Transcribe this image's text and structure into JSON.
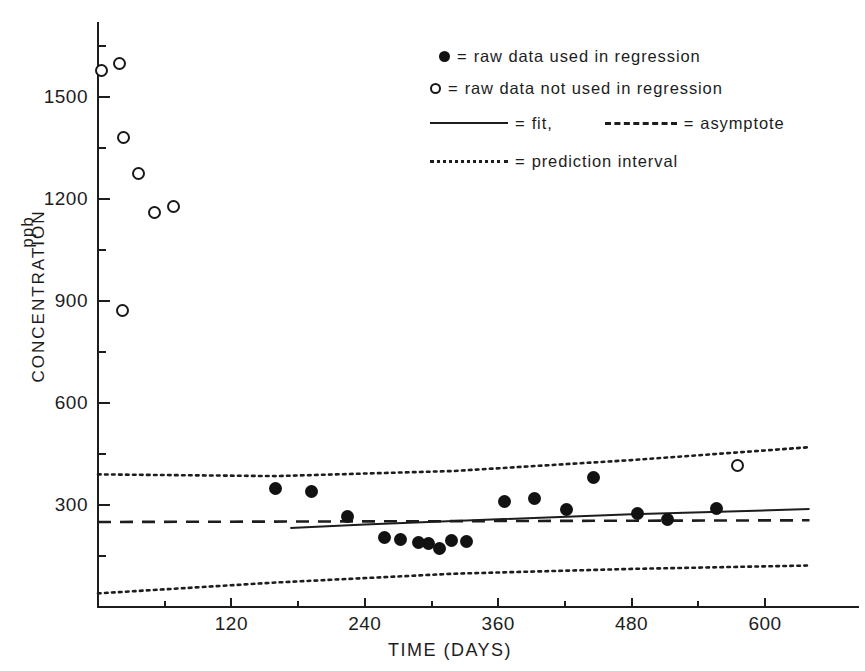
{
  "chart_data": {
    "type": "scatter",
    "title": "",
    "xlabel": "TIME (DAYS)",
    "ylabel": "CONCENTRATION",
    "yunits": "ppb",
    "xlim": [
      0,
      640
    ],
    "ylim": [
      0,
      1740
    ],
    "grid": false,
    "legend_position": "top-right",
    "xticks": [
      120,
      240,
      360,
      480,
      600
    ],
    "xticks_minor": [
      60,
      180,
      300,
      420,
      540,
      600
    ],
    "yticks": [
      300,
      600,
      900,
      1200,
      1500
    ],
    "yticks_minor": [
      150,
      450,
      750,
      1050,
      1350,
      1650
    ],
    "series": [
      {
        "name": "raw data used in regression",
        "marker": "filled-circle",
        "points": [
          {
            "x": 160,
            "y": 348
          },
          {
            "x": 192,
            "y": 340
          },
          {
            "x": 224,
            "y": 265
          },
          {
            "x": 258,
            "y": 205
          },
          {
            "x": 272,
            "y": 200
          },
          {
            "x": 288,
            "y": 190
          },
          {
            "x": 297,
            "y": 186
          },
          {
            "x": 307,
            "y": 172
          },
          {
            "x": 318,
            "y": 197
          },
          {
            "x": 331,
            "y": 194
          },
          {
            "x": 366,
            "y": 310
          },
          {
            "x": 393,
            "y": 318
          },
          {
            "x": 421,
            "y": 286
          },
          {
            "x": 446,
            "y": 380
          },
          {
            "x": 485,
            "y": 276
          },
          {
            "x": 512,
            "y": 258
          },
          {
            "x": 556,
            "y": 291
          }
        ]
      },
      {
        "name": "raw data not used in regression",
        "marker": "open-circle",
        "points": [
          {
            "x": 3,
            "y": 1578
          },
          {
            "x": 19,
            "y": 1600
          },
          {
            "x": 23,
            "y": 1382
          },
          {
            "x": 36,
            "y": 1275
          },
          {
            "x": 51,
            "y": 1160
          },
          {
            "x": 68,
            "y": 1178
          },
          {
            "x": 22,
            "y": 872
          },
          {
            "x": 575,
            "y": 415
          }
        ]
      }
    ],
    "lines": [
      {
        "name": "fit",
        "style": "solid",
        "points": [
          {
            "x": 173,
            "y": 232
          },
          {
            "x": 240,
            "y": 243
          },
          {
            "x": 360,
            "y": 258
          },
          {
            "x": 480,
            "y": 273
          },
          {
            "x": 640,
            "y": 288
          }
        ]
      },
      {
        "name": "asymptote",
        "style": "dashed",
        "points": [
          {
            "x": 0,
            "y": 250
          },
          {
            "x": 640,
            "y": 255
          }
        ]
      },
      {
        "name": "prediction interval upper",
        "style": "dotted",
        "points": [
          {
            "x": 0,
            "y": 390
          },
          {
            "x": 160,
            "y": 385
          },
          {
            "x": 320,
            "y": 400
          },
          {
            "x": 480,
            "y": 432
          },
          {
            "x": 640,
            "y": 470
          }
        ]
      },
      {
        "name": "prediction interval lower",
        "style": "dotted",
        "points": [
          {
            "x": 0,
            "y": 40
          },
          {
            "x": 160,
            "y": 72
          },
          {
            "x": 320,
            "y": 98
          },
          {
            "x": 480,
            "y": 112
          },
          {
            "x": 640,
            "y": 122
          }
        ]
      }
    ]
  },
  "legend": {
    "rows": [
      {
        "symbol": "filled-circle",
        "eq": "=",
        "text": "raw data used in regression"
      },
      {
        "symbol": "open-circle",
        "eq": "=",
        "text": "raw data not used in regression"
      },
      {
        "symbol": "solid-line",
        "eq": "=",
        "text": "fit,",
        "eq2": "=",
        "text2": "asymptote",
        "symbol2": "dashed-line"
      },
      {
        "symbol": "dotted-line",
        "eq": "=",
        "text": "prediction interval"
      }
    ]
  }
}
